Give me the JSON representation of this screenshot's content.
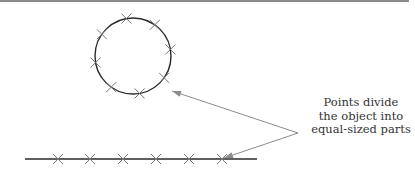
{
  "diagram": {
    "caption_lines": [
      "Points divide",
      "the object into",
      "equal-sized parts"
    ],
    "colors": {
      "shape_stroke": "#2a2a2a",
      "mark_stroke": "#777777",
      "arrow_stroke": "#8c8c8c",
      "text": "#333333",
      "top_rule": "#8a8a8a"
    },
    "circle": {
      "cx": 133,
      "cy": 56,
      "r": 38,
      "marks_count": 8
    },
    "line": {
      "x1": 25,
      "x2": 257,
      "y": 159,
      "marks_x": [
        58,
        90,
        123,
        156,
        189,
        222
      ]
    },
    "arrow_origin": {
      "x": 298,
      "y": 133
    },
    "arrow_targets": [
      {
        "x": 172,
        "y": 91
      },
      {
        "x": 224,
        "y": 158
      }
    ]
  }
}
